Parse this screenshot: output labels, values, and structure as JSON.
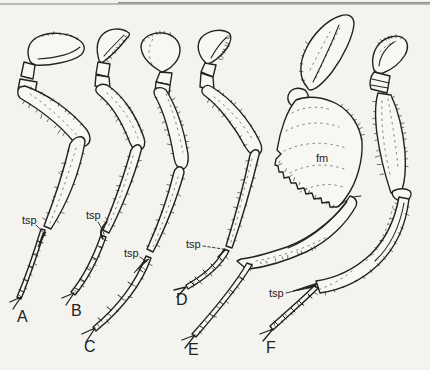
{
  "colors": {
    "ink": "#222222",
    "paper": "#f4f3f0",
    "leg_fill": "#f8f7f4",
    "edge_line": "#8e8e88"
  },
  "panel_labels": {
    "a": "A",
    "b": "B",
    "c": "C",
    "d": "D",
    "e": "E",
    "f": "F"
  },
  "annotation_labels": {
    "tsp": "tsp",
    "fm": "fm"
  }
}
